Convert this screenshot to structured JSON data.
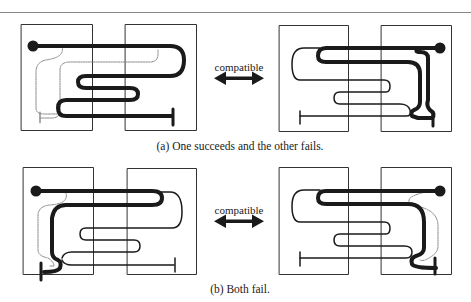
{
  "figure": {
    "panels": [
      {
        "id": "a",
        "caption": "(a) One succeeds and the other fails.",
        "relation_label": "compatible",
        "left_diagram": {
          "description": "Thick path from dot start snakes through two boxes to T-end; thin dotted path shortcuts inside left box"
        },
        "right_diagram": {
          "description": "Thin path snakes through boxes; thick path from dot start loops back to right-box T-end"
        }
      },
      {
        "id": "b",
        "caption": "(b) Both fail.",
        "relation_label": "compatible",
        "left_diagram": {
          "description": "Thick path from dot returns to T-end in left box; thin path snakes to T-end in right box; dotted shortcut"
        },
        "right_diagram": {
          "description": "Thick path from dot returns to T-end in right box; thin path snakes to T-end in left box; dotted shortcut"
        }
      }
    ],
    "colors": {
      "line": "#1a1a1a",
      "dotted": "#8a8a8a",
      "box": "#333333",
      "rule": "#888888"
    }
  }
}
